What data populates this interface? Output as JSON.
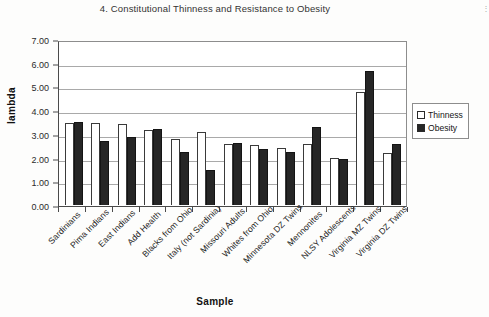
{
  "caption": "4. Constitutional Thinness and Resistance to Obesity",
  "scan_mark": "⋮",
  "legend": {
    "position": "right-middle",
    "items": [
      {
        "label": "Thinness",
        "swatch": "open-square-swatch",
        "color": "#ffffff"
      },
      {
        "label": "Obesity",
        "swatch": "filled-square-swatch",
        "color": "#262626"
      }
    ]
  },
  "chart_data": {
    "type": "bar",
    "title": "4. Constitutional Thinness and Resistance to Obesity",
    "xlabel": "Sample",
    "ylabel": "lambda",
    "ylim": [
      0.0,
      7.0
    ],
    "ytick_step": 1.0,
    "ytick_labels": [
      "0.00",
      "1.00",
      "2.00",
      "3.00",
      "4.00",
      "5.00",
      "6.00",
      "7.00"
    ],
    "ytick_values": [
      0.0,
      1.0,
      2.0,
      3.0,
      4.0,
      5.0,
      6.0,
      7.0
    ],
    "grid": true,
    "grid_axis": "y",
    "legend_position": "right",
    "categories": [
      "Sardinians",
      "Pima Indians",
      "East Indians",
      "Add Health",
      "Blacks from Ohio",
      "Italy (not Sardinia)",
      "Missouri Adults",
      "Whites from Ohio",
      "Minnesota DZ Twins",
      "Mennonites",
      "NLSY Adolescents",
      "Virginia MZ Twins",
      "Virginia DZ Twins"
    ],
    "series": [
      {
        "name": "Thinness",
        "color": "#ffffff",
        "values": [
          3.5,
          3.5,
          3.45,
          3.2,
          2.8,
          3.1,
          2.6,
          2.55,
          2.45,
          2.6,
          2.0,
          4.85,
          2.2
        ]
      },
      {
        "name": "Obesity",
        "color": "#262626",
        "values": [
          3.55,
          2.75,
          2.9,
          3.25,
          2.25,
          1.5,
          2.65,
          2.4,
          2.25,
          3.35,
          1.98,
          5.75,
          2.6
        ]
      }
    ]
  }
}
